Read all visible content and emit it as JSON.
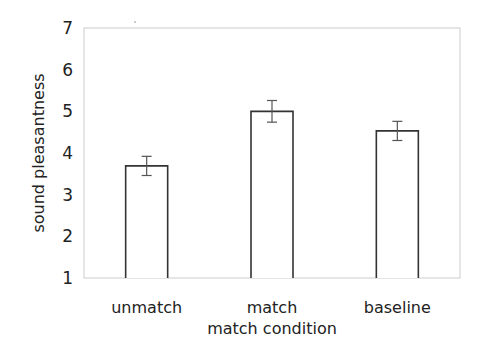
{
  "chart_data": {
    "type": "bar",
    "title": "",
    "xlabel": "match condition",
    "ylabel": "sound pleasantness",
    "categories": [
      "unmatch",
      "match",
      "baseline"
    ],
    "values": [
      3.69,
      5.0,
      4.53
    ],
    "error": [
      0.23,
      0.26,
      0.23
    ],
    "ylim": [
      1,
      7
    ],
    "yticks": [
      "1",
      "2",
      "3",
      "4",
      "5",
      "6",
      "7"
    ],
    "grid": false,
    "legend": null,
    "colors": {
      "bar_fill": "#ffffff",
      "bar_stroke": "#333333",
      "frame": "#cccccc",
      "error_bar": "#555555"
    }
  }
}
